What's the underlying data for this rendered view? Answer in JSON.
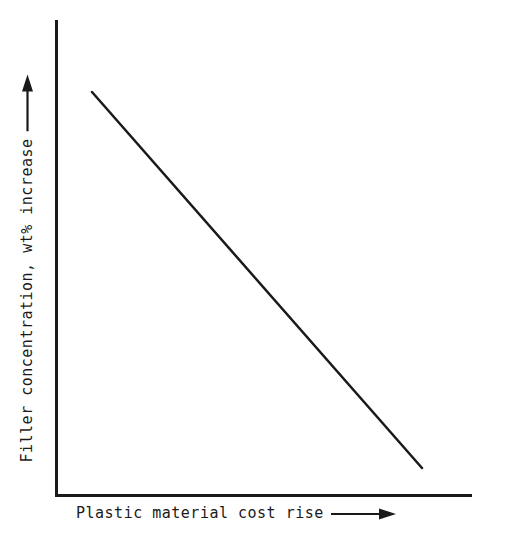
{
  "figure": {
    "background_color": "#ffffff",
    "ink_color": "#1a1a1a",
    "width": 508,
    "height": 536
  },
  "axes": {
    "x_axis": {
      "label_text": "Plastic material cost rise",
      "arrow_glyph": "right-arrow",
      "has_ticks": false,
      "has_tick_labels": false
    },
    "y_axis": {
      "label_text": "Filler concentration, wt% increase",
      "arrow_glyph": "up-arrow",
      "has_ticks": false,
      "has_tick_labels": false
    }
  },
  "chart_data": {
    "type": "line",
    "title": "",
    "subtitle": "",
    "xlabel": "Plastic material cost rise",
    "ylabel": "Filler concentration, wt% increase",
    "xlim": [
      0,
      1
    ],
    "ylim": [
      0,
      1
    ],
    "grid": false,
    "legend": null,
    "axis_style": "open-L-frame-no-ticks",
    "annotations": [
      {
        "name": "x-axis-direction-arrow",
        "text": "→",
        "meaning": "increasing cost"
      },
      {
        "name": "y-axis-direction-arrow",
        "text": "→",
        "meaning": "increasing filler concentration"
      }
    ],
    "series": [
      {
        "name": "filler-concentration-vs-cost",
        "style": "solid",
        "color": "#1a1a1a",
        "linewidth": 2.5,
        "markers": false,
        "relationship": "linear decreasing",
        "x": [
          0.086,
          1.0
        ],
        "y": [
          0.848,
          0.059
        ],
        "points_px": [
          [
            92,
            92
          ],
          [
            422,
            468
          ]
        ]
      }
    ]
  }
}
